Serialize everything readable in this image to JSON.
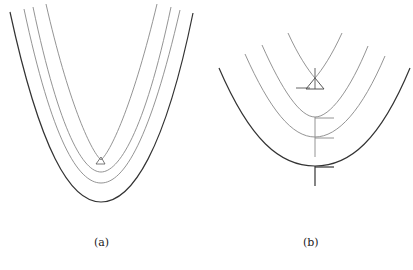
{
  "figure": {
    "panels": [
      {
        "id": "a",
        "caption": "(a)",
        "description": "Four nested parabola-like curves; innermost two meet near a small triangle at the vertex"
      },
      {
        "id": "b",
        "caption": "(b)",
        "description": "Four nested parabolas; innermost has a triangle marker at crossing, with vertical stem and horizontal tick marks at vertices"
      }
    ]
  },
  "colors": {
    "thin": "#8a8a8a",
    "thick": "#333333",
    "marker": "#444444"
  }
}
